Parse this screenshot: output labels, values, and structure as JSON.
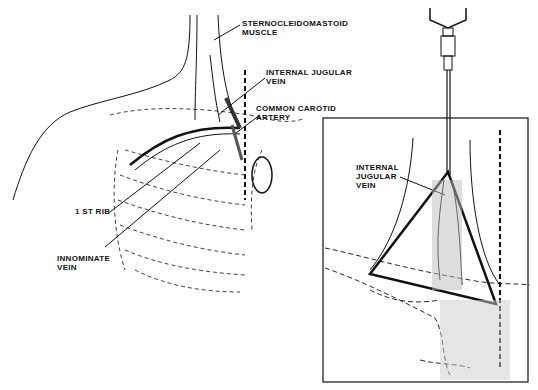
{
  "figure": {
    "left_panel": {
      "labels": {
        "scm": "STERNOCLEIDOMASTOID\nMUSCLE",
        "ijv": "INTERNAL JUGULAR\nVEIN",
        "cca": "COMMON CAROTID\nARTERY",
        "rib": "1 ST RIB",
        "innominate": "INNOMINATE\nVEIN"
      }
    },
    "right_panel": {
      "labels": {
        "ijv": "INTERNAL\nJUGULAR\nVEIN"
      }
    }
  }
}
